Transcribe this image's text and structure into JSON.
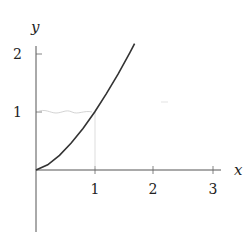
{
  "chart_data": {
    "type": "line",
    "title": "",
    "xlabel": "x",
    "ylabel": "y",
    "xlim": [
      0,
      3.1
    ],
    "ylim": [
      -1.1,
      2.2
    ],
    "xticks": [
      "1",
      "2",
      "3"
    ],
    "yticks": [
      "1",
      "2"
    ],
    "grid": false,
    "series": [
      {
        "name": "y = x^1.5",
        "color": "#333333",
        "x": [
          0,
          0.2,
          0.4,
          0.6,
          0.8,
          1.0,
          1.2,
          1.4,
          1.6,
          1.68
        ],
        "y": [
          0,
          0.089,
          0.253,
          0.465,
          0.716,
          1.0,
          1.315,
          1.657,
          2.024,
          2.178
        ]
      }
    ],
    "annotations": [
      {
        "type": "faint-guide",
        "description": "light gray wavy line near y=1 from x=0 to x=1"
      },
      {
        "type": "faint-guide",
        "description": "light gray vertical line at x=1 from y=0 to y=1"
      }
    ]
  },
  "labels": {
    "x_axis": "x",
    "y_axis": "y",
    "x1": "1",
    "x2": "2",
    "x3": "3",
    "y1": "1",
    "y2": "2"
  }
}
